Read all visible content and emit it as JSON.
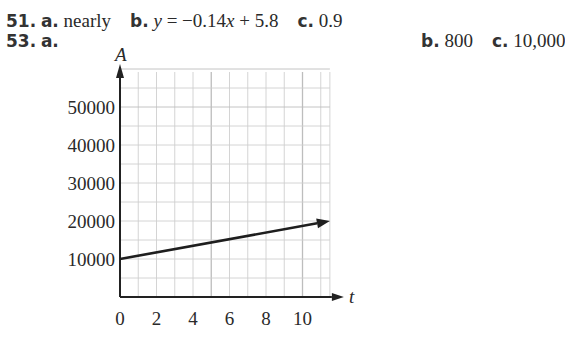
{
  "answers": {
    "p51": {
      "number": "51.",
      "a_label": "a.",
      "a_value": "nearly",
      "b_label": "b.",
      "b_value_prefix": "y",
      "b_value_rest": " = −0.14",
      "b_value_x": "x",
      "b_value_tail": " + 5.8",
      "c_label": "c.",
      "c_value": "0.9"
    },
    "p53": {
      "number": "53.",
      "a_label": "a.",
      "b_label": "b.",
      "b_value": "800",
      "c_label": "c.",
      "c_value": "10,000"
    }
  },
  "chart_data": {
    "type": "line",
    "title": "",
    "xlabel": "t",
    "ylabel": "A",
    "x_ticks": [
      "0",
      "2",
      "4",
      "6",
      "8",
      "10"
    ],
    "y_ticks": [
      "10000",
      "20000",
      "30000",
      "40000",
      "50000"
    ],
    "xlim": [
      0,
      11.5
    ],
    "ylim": [
      0,
      60000
    ],
    "grid": true,
    "grid_x_step": 1,
    "grid_y_step": 5000,
    "series": [
      {
        "name": "A(t)",
        "x": [
          0,
          11.5
        ],
        "values": [
          10000,
          20000
        ],
        "arrow_end": true
      }
    ]
  },
  "colors": {
    "grid": "#cfcfcf",
    "grid_major": "#bdbdbd",
    "axis": "#222222",
    "line": "#1e1e1e"
  }
}
